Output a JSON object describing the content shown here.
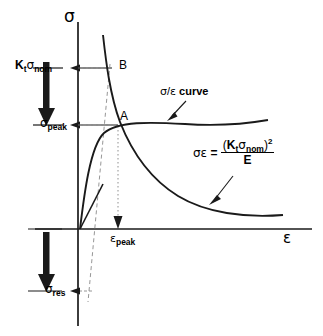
{
  "figure": {
    "type": "neuber-rule-diagram",
    "axes": {
      "y_label": "σ",
      "x_label": "ε",
      "y_axis_name": "sigma-stress-axis",
      "x_axis_name": "epsilon-strain-axis"
    },
    "labels": {
      "kt_sigma_nom": {
        "k": "K",
        "k_sub": "t",
        "sigma": "σ",
        "sigma_sub": "nom"
      },
      "sigma_peak": {
        "sigma": "σ",
        "sub": "peak"
      },
      "sigma_res": {
        "sigma": "σ",
        "sub": "res"
      },
      "epsilon_peak": {
        "eps": "ε",
        "sub": "peak"
      },
      "point_a": "A",
      "point_b": "B",
      "curve_label": {
        "sigma": "σ",
        "slash": "/",
        "eps": "ε",
        "word": "curve"
      }
    },
    "equation": {
      "lhs_sigma": "σ",
      "lhs_eps": "ε",
      "equals": "=",
      "num_open": "(",
      "num_k": "K",
      "num_k_sub": "t",
      "num_sigma": "σ",
      "num_sigma_sub": "nom",
      "num_close": ")",
      "exponent": "2",
      "denominator": "E"
    },
    "colors": {
      "ink": "#1a1a1a",
      "dashed": "#808080",
      "dotted": "#9a9a9a"
    }
  }
}
